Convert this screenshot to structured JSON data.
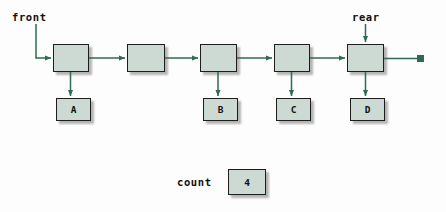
{
  "diagram": {
    "colors": {
      "box_fill": "#ccdad3",
      "box_border": "#1d1d1d",
      "link_color": "#2f6b52",
      "background": "#fdfdfd",
      "text": "#101010"
    },
    "pointers": [
      {
        "id": "front",
        "label": "front",
        "x": 12,
        "y": 11
      },
      {
        "id": "rear",
        "label": "rear",
        "x": 352,
        "y": 11
      }
    ],
    "nodes": [
      {
        "id": "node-1",
        "label": "",
        "x": 53,
        "y": 44,
        "w": 36,
        "h": 28
      },
      {
        "id": "node-2",
        "label": "",
        "x": 127,
        "y": 44,
        "w": 38,
        "h": 28
      },
      {
        "id": "node-3",
        "label": "",
        "x": 200,
        "y": 44,
        "w": 37,
        "h": 28
      },
      {
        "id": "node-4",
        "label": "",
        "x": 274,
        "y": 44,
        "w": 36,
        "h": 28
      },
      {
        "id": "node-5",
        "label": "",
        "x": 347,
        "y": 44,
        "w": 37,
        "h": 28
      }
    ],
    "data_boxes": [
      {
        "id": "data-a",
        "label": "A",
        "x": 56,
        "y": 98,
        "w": 35,
        "h": 23
      },
      {
        "id": "data-b",
        "label": "B",
        "x": 203,
        "y": 98,
        "w": 35,
        "h": 23
      },
      {
        "id": "data-c",
        "label": "C",
        "x": 276,
        "y": 98,
        "w": 35,
        "h": 23
      },
      {
        "id": "data-d",
        "label": "D",
        "x": 350,
        "y": 98,
        "w": 35,
        "h": 23
      }
    ],
    "terminator": {
      "id": "null-terminator",
      "x": 417,
      "y": 55,
      "size": 7
    },
    "count": {
      "label": "count",
      "value": "4",
      "label_x": 177,
      "label_y": 176,
      "box_x": 228,
      "box_y": 169,
      "box_w": 38,
      "box_h": 26
    }
  }
}
